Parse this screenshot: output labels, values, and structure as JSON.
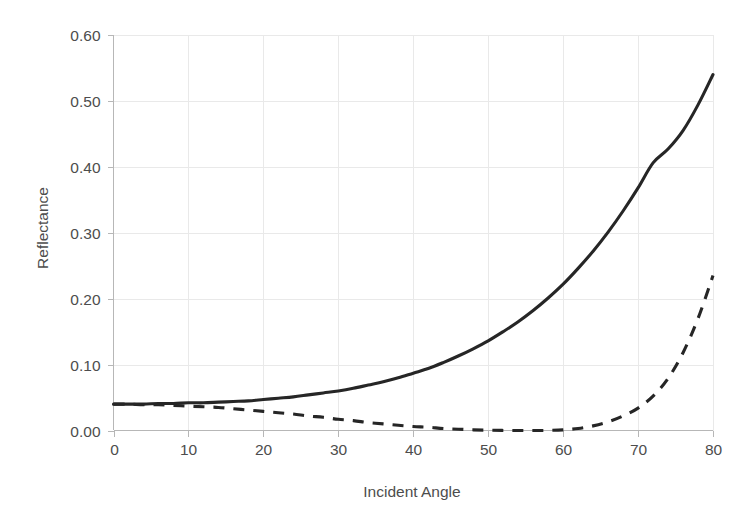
{
  "chart_data": {
    "type": "line",
    "title": "",
    "subtitle": "",
    "xlabel": "Incident Angle",
    "ylabel": "Reflectance",
    "xlim": [
      0,
      80
    ],
    "ylim": [
      0.0,
      0.6
    ],
    "grid": true,
    "legend": "none",
    "x_ticks": [
      "0",
      "10",
      "20",
      "30",
      "40",
      "50",
      "60",
      "70",
      "80"
    ],
    "x_tick_values": [
      0,
      10,
      20,
      30,
      40,
      50,
      60,
      70,
      80
    ],
    "y_ticks": [
      "0.00",
      "0.10",
      "0.20",
      "0.30",
      "0.40",
      "0.50",
      "0.60"
    ],
    "y_tick_values": [
      0.0,
      0.1,
      0.2,
      0.3,
      0.4,
      0.5,
      0.6
    ],
    "x": [
      0,
      2,
      4,
      6,
      8,
      10,
      12,
      14,
      16,
      18,
      20,
      22,
      24,
      26,
      28,
      30,
      32,
      34,
      36,
      38,
      40,
      42,
      44,
      46,
      48,
      50,
      52,
      54,
      56,
      58,
      60,
      62,
      64,
      66,
      68,
      70,
      72,
      74,
      76,
      78,
      80
    ],
    "series": [
      {
        "name": "s-polarized reflectance",
        "style": "solid",
        "color": "#262626",
        "values": [
          0.04,
          0.04,
          0.04,
          0.041,
          0.041,
          0.042,
          0.042,
          0.043,
          0.044,
          0.045,
          0.047,
          0.049,
          0.051,
          0.054,
          0.057,
          0.06,
          0.064,
          0.069,
          0.074,
          0.08,
          0.087,
          0.094,
          0.103,
          0.113,
          0.124,
          0.136,
          0.15,
          0.165,
          0.182,
          0.201,
          0.222,
          0.246,
          0.272,
          0.301,
          0.333,
          0.368,
          0.406,
          0.427,
          0.455,
          0.494,
          0.54
        ]
      },
      {
        "name": "p-polarized reflectance",
        "style": "dashed",
        "color": "#262626",
        "values": [
          0.04,
          0.04,
          0.039,
          0.039,
          0.038,
          0.037,
          0.036,
          0.035,
          0.033,
          0.031,
          0.029,
          0.027,
          0.025,
          0.022,
          0.02,
          0.017,
          0.015,
          0.012,
          0.01,
          0.008,
          0.006,
          0.005,
          0.003,
          0.002,
          0.001,
          0.0005,
          0.0001,
          0.0,
          0.0,
          0.0002,
          0.001,
          0.003,
          0.007,
          0.013,
          0.022,
          0.034,
          0.052,
          0.079,
          0.118,
          0.17,
          0.235
        ]
      }
    ]
  }
}
